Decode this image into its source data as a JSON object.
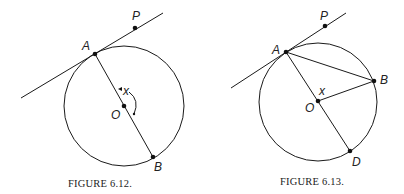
{
  "figures": [
    {
      "caption": "FIGURE 6.12.",
      "labels": {
        "P": "P",
        "A": "A",
        "O": "O",
        "B": "B",
        "x": "x"
      },
      "description": "Circle with center O, diameter AB, tangent line at A passing through P, angle x marked between OA and OB"
    },
    {
      "caption": "FIGURE 6.13.",
      "labels": {
        "P": "P",
        "A": "A",
        "O": "O",
        "B": "B",
        "D": "D",
        "x": "x"
      },
      "description": "Circle with center O, diameter AD, chord AB, radius OB, tangent line at A passing through P, angle x at O"
    }
  ]
}
